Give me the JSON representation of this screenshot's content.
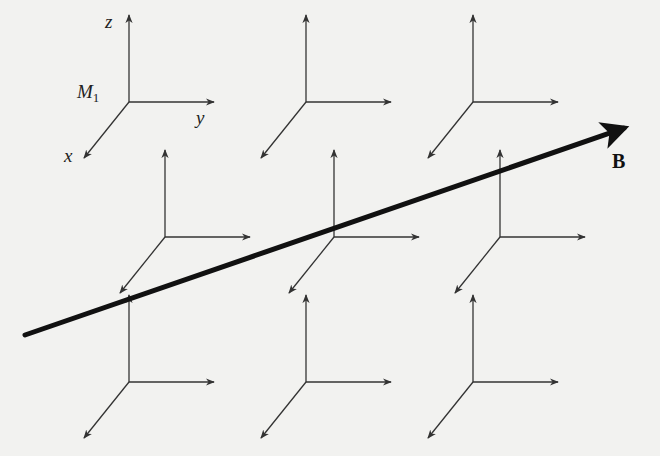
{
  "diagram": {
    "title": "",
    "frame_label": "M",
    "frame_label_subscript": "1",
    "axis_labels": {
      "z": "z",
      "y": "y",
      "x": "x"
    },
    "field_label": "B",
    "colors": {
      "background": "#f2f2f0",
      "axis": "#333333",
      "field_arrow": "#111111"
    },
    "frames": [
      {
        "row": 1,
        "x": 129,
        "y": 102,
        "labeled": true
      },
      {
        "row": 1,
        "x": 306,
        "y": 102
      },
      {
        "row": 1,
        "x": 473,
        "y": 102
      },
      {
        "row": 2,
        "x": 165,
        "y": 237
      },
      {
        "row": 2,
        "x": 334,
        "y": 237
      },
      {
        "row": 2,
        "x": 500,
        "y": 237
      },
      {
        "row": 3,
        "x": 129,
        "y": 382
      },
      {
        "row": 3,
        "x": 306,
        "y": 382
      },
      {
        "row": 3,
        "x": 473,
        "y": 382
      }
    ],
    "field_arrow": {
      "x1": 25,
      "y1": 335,
      "x2": 642,
      "y2": 122
    }
  }
}
